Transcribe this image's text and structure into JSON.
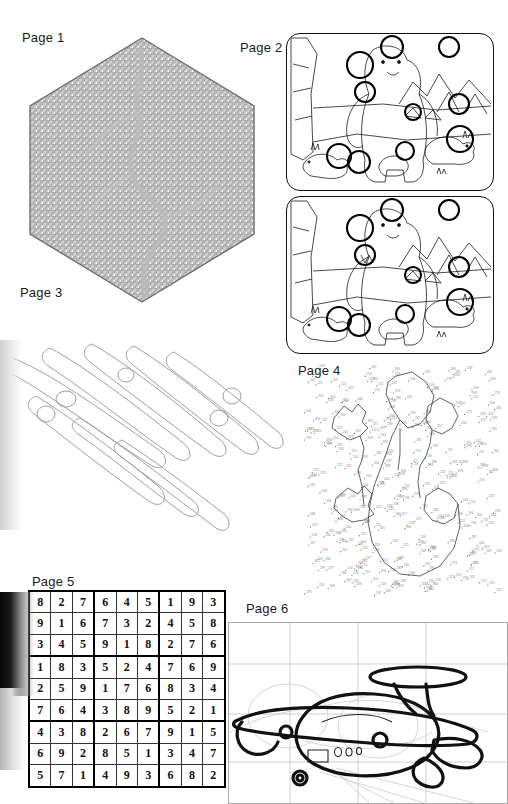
{
  "document": {
    "kind": "scanned-activity-book-answer-pages",
    "background_color": "#ffffff",
    "ink_color": "#111111",
    "faded_ink_color": "#9a9a9a"
  },
  "pages": [
    {
      "id": "page-1",
      "label": "Page 1",
      "puzzle_type": "maze",
      "shape": "hexagon",
      "description": "Hexagonal maze with solution path traced in grey",
      "label_pos": {
        "x": 22,
        "y": 30
      }
    },
    {
      "id": "page-2",
      "label": "Page 2",
      "puzzle_type": "spot-the-difference",
      "scene": "polar bears on ice with mountains",
      "panels": 2,
      "differences_circled": 9,
      "label_pos": {
        "x": 240,
        "y": 40
      }
    },
    {
      "id": "page-3",
      "label": "Page 3",
      "puzzle_type": "word-search",
      "grid_columns": 21,
      "grid_rows": 26,
      "answers_circled": true,
      "label_pos": {
        "x": 20,
        "y": 285
      }
    },
    {
      "id": "page-4",
      "label": "Page 4",
      "puzzle_type": "connect-the-dots",
      "description": "Numbered dot-to-dot, two flowers / butterfly shapes outlined",
      "label_pos": {
        "x": 298,
        "y": 363
      }
    },
    {
      "id": "page-5",
      "label": "Page 5",
      "puzzle_type": "sudoku",
      "state": "solved",
      "label_pos": {
        "x": 32,
        "y": 574
      }
    },
    {
      "id": "page-6",
      "label": "Page 6",
      "puzzle_type": "how-to-draw",
      "subject": "airplane",
      "description": "Cartoon propeller airplane over construction grid",
      "label_pos": {
        "x": 246,
        "y": 601
      }
    }
  ],
  "sudoku": {
    "rows": [
      [
        8,
        2,
        7,
        6,
        4,
        5,
        1,
        9,
        3
      ],
      [
        9,
        1,
        6,
        7,
        3,
        2,
        4,
        5,
        8
      ],
      [
        3,
        4,
        5,
        9,
        1,
        8,
        2,
        7,
        6
      ],
      [
        1,
        8,
        3,
        5,
        2,
        4,
        7,
        6,
        9
      ],
      [
        2,
        5,
        9,
        1,
        7,
        6,
        8,
        3,
        4
      ],
      [
        7,
        6,
        4,
        3,
        8,
        9,
        5,
        2,
        1
      ],
      [
        4,
        3,
        8,
        2,
        6,
        7,
        9,
        1,
        5
      ],
      [
        6,
        9,
        2,
        8,
        5,
        1,
        3,
        4,
        7
      ],
      [
        5,
        7,
        1,
        4,
        9,
        3,
        6,
        8,
        2
      ]
    ]
  },
  "word_search": {
    "letters": [
      "WY..BXO..KPZ..DZB..LWP",
      "PDU..SDG..YGL..SZE..GOX",
      "GLF..BIL..HAF..LIE..TNG",
      "WIL..WYK..VCC..VXE..XBW",
      "NKA..IEB..AUG..SOK..GI",
      "NQMK..BAO..LCC..ZDO..V",
      "BOT..CKE..ANO..YNK..RIH",
      "MTE..AKE..IEB..PSN..EZW",
      "UEW..VES..OMM..GFA..GLB",
      "RSE..EAF..YTZ..SUS..OF",
      "ATG..PGC..WCA..ZEL..TCT",
      "DCN..PUB..BES..DEM..KKE",
      "KAE..ZNH..NDA..EVD..DEK",
      "KQL..USK..CXD..DOW..NEA",
      "ETI..JSX..GQ..GES..LE",
      "AWJ..GC..KBJ..GZS..IET",
      "MGQ..SHV..PJ..JHT..ZJL",
      "JEB..QBQ..GST..IKW..LGG",
      "IWA..FTZ..NIE..ZSH..KUS",
      "CVS..YPW..OIG..NCG..TB",
      "UZPT..USI..KTO..KGI..K",
      "JGH..XDA..FFQ..AEI..EBO",
      "VKG..MKE..LKK..MUS..YRS",
      "TGL..NLG..OWS..UET..VCL",
      "JHA..MBE..MQY..SEG..GX"
    ],
    "alphabet": "ABCDEFGHIJKLMNOPQRSTUVWXYZ",
    "circled_word_count": 10
  },
  "dot_to_dot": {
    "number_range_low": 200,
    "number_range_high": 300,
    "sample_numbers": [
      201,
      205,
      209,
      212,
      214,
      217,
      220,
      223,
      226,
      229,
      232,
      235,
      238,
      241,
      244,
      247,
      250,
      253,
      256,
      259,
      262,
      265,
      268,
      271,
      274,
      277,
      280,
      283,
      286,
      289,
      292,
      295,
      298,
      300
    ]
  },
  "maze": {
    "sides": 6,
    "solution_shown": true
  }
}
